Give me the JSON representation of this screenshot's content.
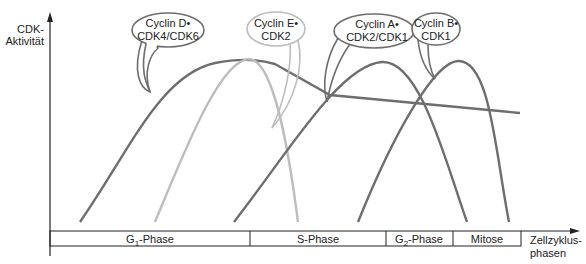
{
  "diagram": {
    "y_axis_label_line1": "CDK-",
    "y_axis_label_line2": "Aktivität",
    "x_axis_label_line1": "Zellzyklus-",
    "x_axis_label_line2": "phasen",
    "colors": {
      "dark_curve": "#6e6e6e",
      "light_curve": "#bdbdbd",
      "axis": "#222222",
      "background": "#ffffff"
    },
    "complexes": [
      {
        "line1": "Cyclin D•",
        "line2": "CDK4/CDK6",
        "shade": "dark"
      },
      {
        "line1": "Cyclin E•",
        "line2": "CDK2",
        "shade": "light"
      },
      {
        "line1": "Cyclin A•",
        "line2": "CDK2/CDK1",
        "shade": "dark"
      },
      {
        "line1": "Cyclin B•",
        "line2": "CDK1",
        "shade": "dark"
      }
    ],
    "phases": [
      {
        "main": "G",
        "sub": "1",
        "suffix": "-Phase"
      },
      {
        "main": "S-Phase",
        "sub": "",
        "suffix": ""
      },
      {
        "main": "G",
        "sub": "2",
        "suffix": "-Phase"
      },
      {
        "main": "Mitose",
        "sub": "",
        "suffix": ""
      }
    ]
  }
}
